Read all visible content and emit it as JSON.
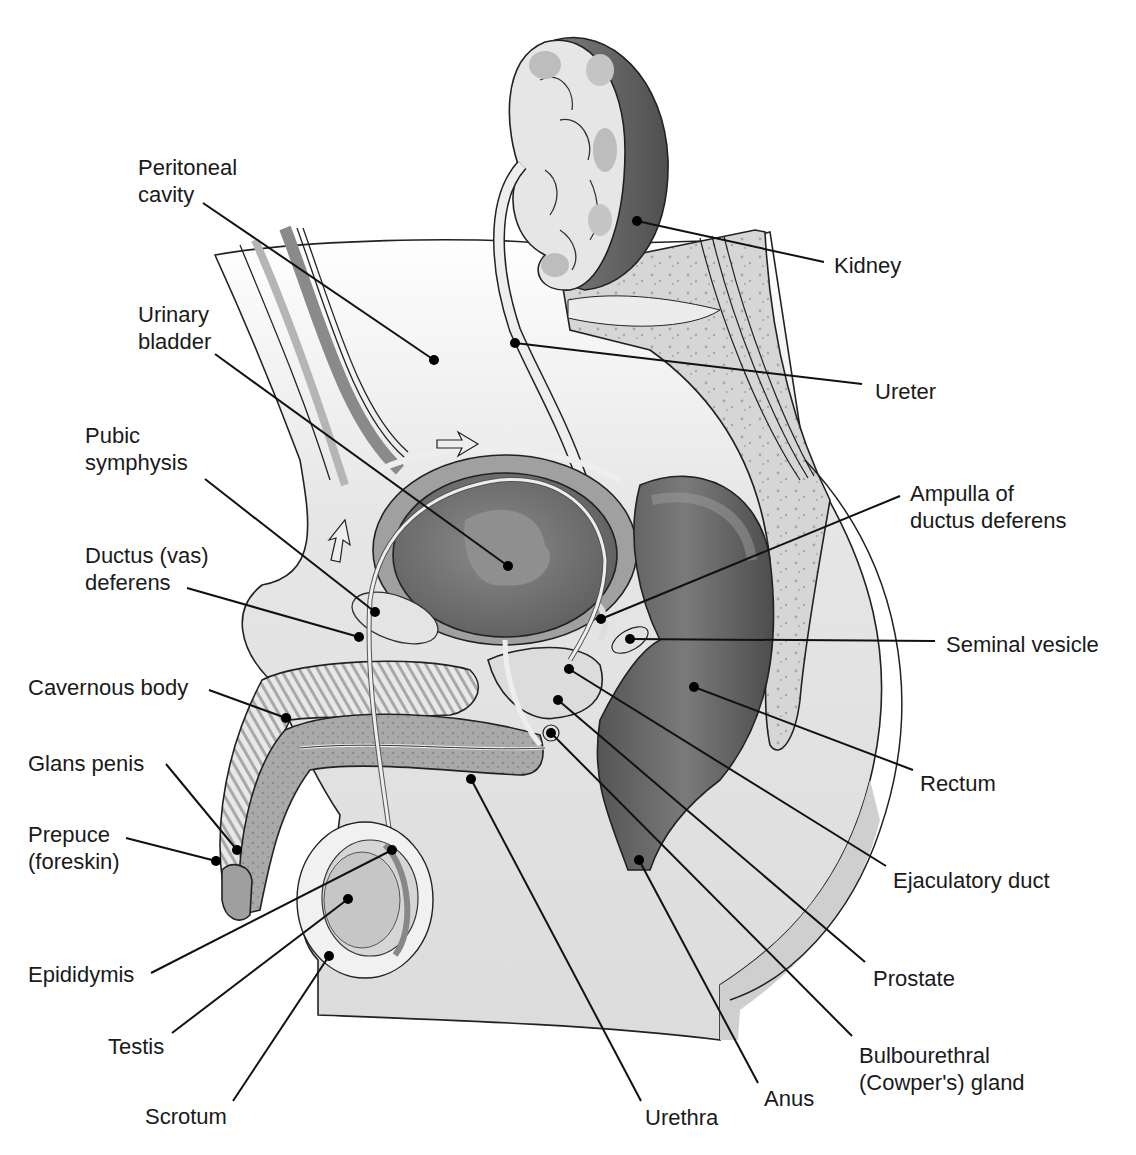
{
  "figure": {
    "colors": {
      "background": "#ffffff",
      "body_fill": "#e9e9e9",
      "body_shade": "#d4d4d4",
      "bladder_dark": "#6e6e6e",
      "bladder_light": "#9a9a9a",
      "rectum_dark": "#5a5a5a",
      "rectum_light": "#7c7c7c",
      "bone": "#d0d0d0",
      "tissue_light": "#f3f3f3",
      "kidney_rim": "#707070",
      "kidney_inner": "#e4e4e4",
      "spongy": "#a8a8a8",
      "line": "#111111"
    }
  },
  "labels": [
    {
      "id": "peritoneal-cavity",
      "lines": [
        "Peritoneal",
        "cavity"
      ],
      "x": 138,
      "y": 175,
      "anchor": "start",
      "leader": [
        [
          203,
          203
        ],
        [
          434,
          360
        ]
      ],
      "dot": [
        434,
        360
      ]
    },
    {
      "id": "urinary-bladder",
      "lines": [
        "Urinary",
        "bladder"
      ],
      "x": 138,
      "y": 322,
      "anchor": "start",
      "leader": [
        [
          215,
          354
        ],
        [
          508,
          566
        ]
      ],
      "dot": [
        508,
        566
      ]
    },
    {
      "id": "pubic-symphysis",
      "lines": [
        "Pubic",
        "symphysis"
      ],
      "x": 85,
      "y": 443,
      "anchor": "start",
      "leader": [
        [
          205,
          479
        ],
        [
          375,
          612
        ]
      ],
      "dot": [
        375,
        612
      ]
    },
    {
      "id": "ductus-vas-deferens",
      "lines": [
        "Ductus (vas)",
        "deferens"
      ],
      "x": 85,
      "y": 563,
      "anchor": "start",
      "leader": [
        [
          187,
          588
        ],
        [
          359,
          637
        ]
      ],
      "dot": [
        359,
        637
      ]
    },
    {
      "id": "cavernous-body",
      "lines": [
        "Cavernous body"
      ],
      "x": 28,
      "y": 695,
      "anchor": "start",
      "leader": [
        [
          209,
          690
        ],
        [
          286,
          718
        ]
      ],
      "dot": [
        286,
        718
      ]
    },
    {
      "id": "glans-penis",
      "lines": [
        "Glans penis"
      ],
      "x": 28,
      "y": 771,
      "anchor": "start",
      "leader": [
        [
          166,
          764
        ],
        [
          237,
          850
        ]
      ],
      "dot": [
        237,
        850
      ]
    },
    {
      "id": "prepuce-foreskin",
      "lines": [
        "Prepuce",
        "(foreskin)"
      ],
      "x": 28,
      "y": 842,
      "anchor": "start",
      "leader": [
        [
          126,
          838
        ],
        [
          216,
          861
        ]
      ],
      "dot": [
        216,
        861
      ]
    },
    {
      "id": "epididymis",
      "lines": [
        "Epididymis"
      ],
      "x": 28,
      "y": 982,
      "anchor": "start",
      "leader": [
        [
          151,
          973
        ],
        [
          392,
          850
        ]
      ],
      "dot": [
        392,
        850
      ]
    },
    {
      "id": "testis",
      "lines": [
        "Testis"
      ],
      "x": 108,
      "y": 1054,
      "anchor": "start",
      "leader": [
        [
          172,
          1033
        ],
        [
          348,
          899
        ]
      ],
      "dot": [
        348,
        899
      ]
    },
    {
      "id": "scrotum",
      "lines": [
        "Scrotum"
      ],
      "x": 145,
      "y": 1124,
      "anchor": "start",
      "leader": [
        [
          233,
          1101
        ],
        [
          329,
          956
        ]
      ],
      "dot": [
        329,
        956
      ]
    },
    {
      "id": "urethra",
      "lines": [
        "Urethra"
      ],
      "x": 645,
      "y": 1125,
      "anchor": "start",
      "leader": [
        [
          641,
          1101
        ],
        [
          471,
          779
        ]
      ],
      "dot": [
        471,
        779
      ]
    },
    {
      "id": "anus",
      "lines": [
        "Anus"
      ],
      "x": 764,
      "y": 1106,
      "anchor": "start",
      "leader": [
        [
          758,
          1083
        ],
        [
          639,
          860
        ]
      ],
      "dot": [
        639,
        860
      ]
    },
    {
      "id": "bulbourethral-cowpers-gland",
      "lines": [
        "Bulbourethral",
        "(Cowper's) gland"
      ],
      "x": 859,
      "y": 1063,
      "anchor": "start",
      "leader": [
        [
          852,
          1036
        ],
        [
          551,
          733
        ]
      ],
      "dot": [
        551,
        733
      ]
    },
    {
      "id": "prostate",
      "lines": [
        "Prostate"
      ],
      "x": 873,
      "y": 986,
      "anchor": "start",
      "leader": [
        [
          865,
          962
        ],
        [
          558,
          700
        ]
      ],
      "dot": [
        558,
        700
      ]
    },
    {
      "id": "ejaculatory-duct",
      "lines": [
        "Ejaculatory duct"
      ],
      "x": 893,
      "y": 888,
      "anchor": "start",
      "leader": [
        [
          886,
          866
        ],
        [
          569,
          669
        ]
      ],
      "dot": [
        569,
        669
      ]
    },
    {
      "id": "rectum",
      "lines": [
        "Rectum"
      ],
      "x": 920,
      "y": 791,
      "anchor": "start",
      "leader": [
        [
          913,
          770
        ],
        [
          694,
          687
        ]
      ],
      "dot": [
        694,
        687
      ]
    },
    {
      "id": "seminal-vesicle",
      "lines": [
        "Seminal vesicle"
      ],
      "x": 946,
      "y": 652,
      "anchor": "start",
      "leader": [
        [
          935,
          641
        ],
        [
          630,
          639
        ]
      ],
      "dot": [
        630,
        639
      ]
    },
    {
      "id": "ampulla-of-ductus-deferens",
      "lines": [
        "Ampulla of",
        "ductus deferens"
      ],
      "x": 910,
      "y": 501,
      "anchor": "start",
      "leader": [
        [
          900,
          496
        ],
        [
          601,
          619
        ]
      ],
      "dot": [
        601,
        619
      ]
    },
    {
      "id": "ureter",
      "lines": [
        "Ureter"
      ],
      "x": 875,
      "y": 399,
      "anchor": "start",
      "leader": [
        [
          862,
          384
        ],
        [
          515,
          343
        ]
      ],
      "dot": [
        515,
        343
      ]
    },
    {
      "id": "kidney",
      "lines": [
        "Kidney"
      ],
      "x": 834,
      "y": 273,
      "anchor": "start",
      "leader": [
        [
          824,
          262
        ],
        [
          637,
          221
        ]
      ],
      "dot": [
        637,
        221
      ]
    }
  ]
}
